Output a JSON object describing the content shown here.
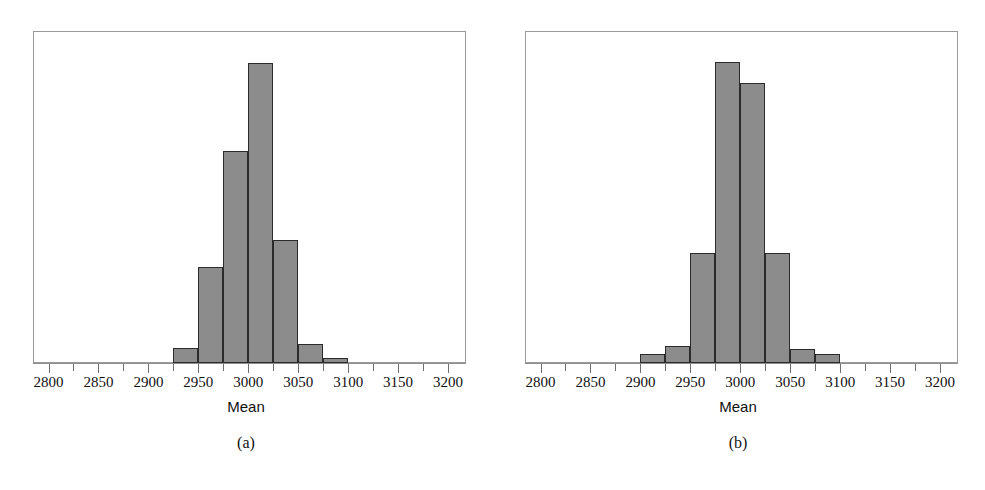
{
  "figure": {
    "background_color": "#ffffff",
    "bar_fill_color": "#8c8c8c",
    "bar_edge_color": "#2b2b2b",
    "axis_color": "#8f8f8f"
  },
  "panels": [
    {
      "caption": "(a)",
      "xlabel": "Mean",
      "tick_labels": [
        "2800",
        "2850",
        "2900",
        "2950",
        "3000",
        "3050",
        "3100",
        "3150",
        "3200"
      ]
    },
    {
      "caption": "(b)",
      "xlabel": "Mean",
      "tick_labels": [
        "2800",
        "2850",
        "2900",
        "2950",
        "3000",
        "3050",
        "3100",
        "3150",
        "3200"
      ]
    }
  ],
  "chart_data": [
    {
      "type": "bar",
      "title": "",
      "subtitle": "",
      "xlabel": "Mean",
      "ylabel": "",
      "annotation": "(a)",
      "grid": false,
      "legend": "none",
      "xlim": [
        2800,
        3200
      ],
      "xticks": [
        2800,
        2850,
        2900,
        2950,
        3000,
        3050,
        3100,
        3150,
        3200
      ],
      "xtick_labels": [
        "2800",
        "2850",
        "2900",
        "2950",
        "3000",
        "3050",
        "3100",
        "3150",
        "3200"
      ],
      "minor_tick_step": 25,
      "ylim": [
        0,
        100
      ],
      "yticks": [],
      "bin_width": 25,
      "bin_edges": [
        2925,
        2950,
        2975,
        3000,
        3025,
        3050,
        3075,
        3100
      ],
      "categories": [
        "2925-2950",
        "2950-2975",
        "2975-3000",
        "3000-3025",
        "3025-3050",
        "3050-3075",
        "3075-3100"
      ],
      "values": [
        4.5,
        29,
        64,
        90.5,
        37,
        5.7,
        1.5
      ],
      "values_note": "relative frequency heights read off the plot as percent of panel height"
    },
    {
      "type": "bar",
      "title": "",
      "subtitle": "",
      "xlabel": "Mean",
      "ylabel": "",
      "annotation": "(b)",
      "grid": false,
      "legend": "none",
      "xlim": [
        2800,
        3200
      ],
      "xticks": [
        2800,
        2850,
        2900,
        2950,
        3000,
        3050,
        3100,
        3150,
        3200
      ],
      "xtick_labels": [
        "2800",
        "2850",
        "2900",
        "2950",
        "3000",
        "3050",
        "3100",
        "3150",
        "3200"
      ],
      "minor_tick_step": 25,
      "ylim": [
        0,
        100
      ],
      "yticks": [],
      "bin_width": 25,
      "bin_edges": [
        2900,
        2925,
        2950,
        2975,
        3000,
        3025,
        3050,
        3075,
        3100
      ],
      "categories": [
        "2900-2925",
        "2925-2950",
        "2950-2975",
        "2975-3000",
        "3000-3025",
        "3025-3050",
        "3050-3075",
        "3075-3100"
      ],
      "values": [
        2.7,
        5.1,
        33,
        90.7,
        84.3,
        33,
        4.2,
        2.7
      ],
      "values_note": "relative frequency heights read off the plot as percent of panel height"
    }
  ]
}
